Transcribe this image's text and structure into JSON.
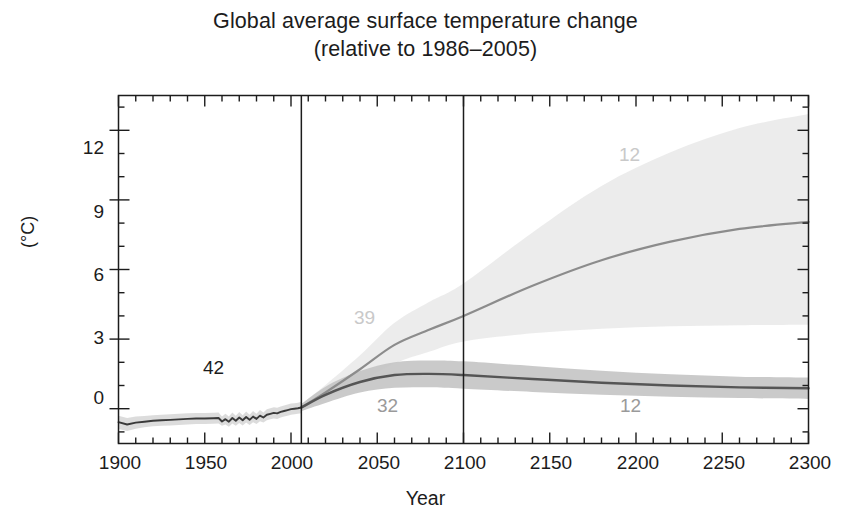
{
  "chart_data": {
    "type": "line",
    "title": "Global average surface temperature change",
    "subtitle": "(relative to 1986–2005)",
    "xlabel": "Year",
    "ylabel": "(°C)",
    "xlim": [
      1900,
      2300
    ],
    "ylim": [
      -1.5,
      13.5
    ],
    "grid": false,
    "legend_position": "inline-annotations",
    "x_ticks": [
      1900,
      1950,
      2000,
      2050,
      2100,
      2150,
      2200,
      2250,
      2300
    ],
    "x_minor_tick_interval": 10,
    "y_ticks": [
      0,
      3,
      6,
      9,
      12
    ],
    "y_minor_tick_interval": 1,
    "vertical_divider_years": [
      2006,
      2100
    ],
    "colors": {
      "historical": "#3a3a3a",
      "historical_band": "#d8d8d8",
      "rcp26": "#555555",
      "rcp26_band": "#c4c4c4",
      "rcp85": "#8c8c8c",
      "rcp85_band": "#e6e6e6"
    },
    "annotations": [
      {
        "label": "42",
        "x": 1955,
        "y": 1.9,
        "color": "#1c1c1c",
        "series": "historical",
        "meaning": "number of models"
      },
      {
        "label": "39",
        "x": 2037,
        "y": 4.05,
        "color": "#c9c9c9",
        "series": "rcp85",
        "meaning": "number of models"
      },
      {
        "label": "32",
        "x": 2049,
        "y": -0.45,
        "color": "#9a9a9a",
        "series": "rcp26",
        "meaning": "number of models"
      },
      {
        "label": "12",
        "x": 2195,
        "y": 12.15,
        "color": "#c9c9c9",
        "series": "rcp85",
        "meaning": "number of models"
      },
      {
        "label": "12",
        "x": 2192,
        "y": -0.7,
        "color": "#9a9a9a",
        "series": "rcp26",
        "meaning": "number of models"
      }
    ],
    "series": [
      {
        "name": "historical",
        "label": "Historical",
        "color": "#3a3a3a",
        "x": [
          1900,
          1905,
          1910,
          1915,
          1920,
          1925,
          1930,
          1935,
          1940,
          1945,
          1950,
          1955,
          1958,
          1960,
          1962,
          1964,
          1966,
          1968,
          1970,
          1972,
          1974,
          1976,
          1978,
          1980,
          1982,
          1984,
          1986,
          1988,
          1990,
          1992,
          1994,
          1996,
          1998,
          2000,
          2002,
          2004,
          2006
        ],
        "values": [
          -0.58,
          -0.68,
          -0.6,
          -0.56,
          -0.52,
          -0.5,
          -0.48,
          -0.46,
          -0.44,
          -0.42,
          -0.42,
          -0.41,
          -0.4,
          -0.55,
          -0.45,
          -0.56,
          -0.4,
          -0.52,
          -0.38,
          -0.5,
          -0.36,
          -0.48,
          -0.34,
          -0.44,
          -0.3,
          -0.38,
          -0.26,
          -0.22,
          -0.18,
          -0.2,
          -0.14,
          -0.1,
          -0.06,
          -0.02,
          0.0,
          0.02,
          0.05
        ],
        "band_lo": [
          -0.88,
          -0.96,
          -0.86,
          -0.8,
          -0.76,
          -0.74,
          -0.72,
          -0.7,
          -0.68,
          -0.66,
          -0.66,
          -0.65,
          -0.64,
          -0.74,
          -0.68,
          -0.78,
          -0.64,
          -0.74,
          -0.62,
          -0.72,
          -0.6,
          -0.7,
          -0.58,
          -0.66,
          -0.54,
          -0.6,
          -0.5,
          -0.46,
          -0.42,
          -0.44,
          -0.38,
          -0.34,
          -0.3,
          -0.26,
          -0.24,
          -0.22,
          -0.2
        ],
        "band_hi": [
          -0.3,
          -0.4,
          -0.34,
          -0.32,
          -0.28,
          -0.26,
          -0.24,
          -0.22,
          -0.2,
          -0.18,
          -0.18,
          -0.17,
          -0.16,
          -0.34,
          -0.22,
          -0.34,
          -0.16,
          -0.3,
          -0.14,
          -0.28,
          -0.12,
          -0.26,
          -0.1,
          -0.22,
          -0.06,
          -0.16,
          -0.02,
          0.02,
          0.06,
          0.04,
          0.1,
          0.14,
          0.18,
          0.22,
          0.24,
          0.26,
          0.3
        ]
      },
      {
        "name": "rcp26",
        "label": "RCP2.6",
        "color": "#555555",
        "x": [
          2006,
          2020,
          2040,
          2060,
          2080,
          2100,
          2140,
          2180,
          2220,
          2260,
          2300
        ],
        "values": [
          0.05,
          0.6,
          1.15,
          1.45,
          1.5,
          1.45,
          1.28,
          1.12,
          1.0,
          0.92,
          0.88
        ],
        "band_lo": [
          -0.1,
          0.25,
          0.7,
          0.9,
          0.92,
          0.86,
          0.72,
          0.6,
          0.52,
          0.46,
          0.42
        ],
        "band_hi": [
          0.2,
          0.95,
          1.62,
          2.0,
          2.08,
          2.04,
          1.84,
          1.64,
          1.48,
          1.38,
          1.34
        ]
      },
      {
        "name": "rcp85",
        "label": "RCP8.5",
        "color": "#8c8c8c",
        "x": [
          2006,
          2020,
          2040,
          2060,
          2080,
          2100,
          2140,
          2180,
          2220,
          2260,
          2300
        ],
        "values": [
          0.05,
          0.7,
          1.7,
          2.75,
          3.4,
          4.0,
          5.3,
          6.4,
          7.2,
          7.75,
          8.05
        ],
        "band_lo": [
          -0.1,
          0.4,
          1.15,
          1.95,
          2.45,
          2.9,
          3.25,
          3.45,
          3.55,
          3.6,
          3.62
        ],
        "band_hi": [
          0.2,
          1.02,
          2.3,
          3.7,
          4.6,
          5.4,
          7.6,
          9.6,
          11.05,
          12.1,
          12.7
        ]
      }
    ]
  },
  "chart": {
    "title_line1": "Global average surface temperature change",
    "title_line2": "(relative to 1986–2005)",
    "y_axis_label": "(°C)",
    "x_axis_label": "Year",
    "y_tick_labels": [
      "12",
      "9",
      "6",
      "3",
      "0"
    ],
    "x_tick_labels": [
      "1900",
      "1950",
      "2000",
      "2050",
      "2100",
      "2150",
      "2200",
      "2250",
      "2300"
    ],
    "annotation_labels": [
      "42",
      "39",
      "32",
      "12",
      "12"
    ]
  }
}
